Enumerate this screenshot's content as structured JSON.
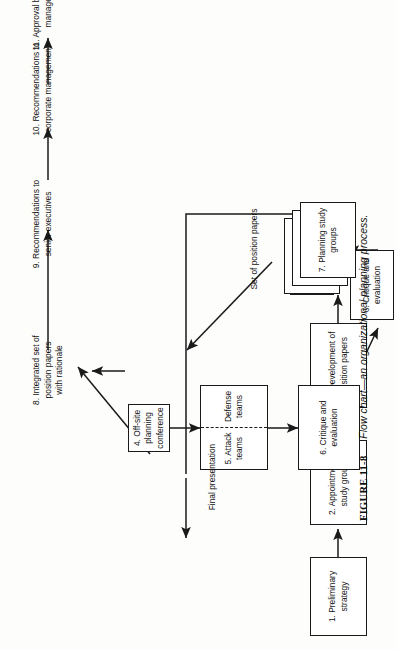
{
  "figure": {
    "number": "FIGURE 11-8",
    "caption": "Flow chart—an organizational planning process."
  },
  "diagram": {
    "nodes": [
      {
        "id": "n1",
        "label": "1. Preliminary strategy"
      },
      {
        "id": "n2",
        "label": "2. Appointment of\nstudy groups"
      },
      {
        "id": "n3",
        "label": "3. Development of\nposition papers"
      },
      {
        "id": "n4",
        "label": "4. Off-site planning\nconference"
      },
      {
        "id": "n5a",
        "label": "5. Attack teams"
      },
      {
        "id": "n5b",
        "label": "Defense teams"
      },
      {
        "id": "n6",
        "label": "6. Critique and\nevaluation"
      },
      {
        "id": "n7",
        "label": "7. Planning study\ngroups"
      },
      {
        "id": "n8",
        "label": "8. Integrated set of\nposition papers\nwith rationale"
      },
      {
        "id": "n9",
        "label": "9. Recommendations to\nsenior executives"
      },
      {
        "id": "n10",
        "label": "10. Recommendations to\ncorporate management"
      },
      {
        "id": "n11",
        "label": "11. Approval by corporate\nmanagement"
      },
      {
        "id": "n12",
        "label": "12. Publication of\nstrategic objectives"
      }
    ],
    "annotations": [
      {
        "id": "a1",
        "label": "Set of position papers"
      },
      {
        "id": "a2",
        "label": "Final presentation"
      }
    ]
  }
}
